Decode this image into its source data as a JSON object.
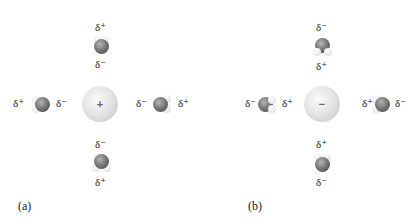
{
  "figure": {
    "panels": [
      {
        "label": "(a)",
        "ion": {
          "sign": "+",
          "description": "cation"
        },
        "waters": {
          "top": {
            "near": "δ⁻",
            "far": "δ⁺"
          },
          "bottom": {
            "near": "δ⁻",
            "far": "δ⁺"
          },
          "left": {
            "near": "δ⁻",
            "far": "δ⁺"
          },
          "right": {
            "near": "δ⁻",
            "far": "δ⁺"
          }
        }
      },
      {
        "label": "(b)",
        "ion": {
          "sign": "−",
          "description": "anion"
        },
        "waters": {
          "top": {
            "near": "δ⁺",
            "far": "δ⁻"
          },
          "bottom": {
            "near": "δ⁺",
            "far": "δ⁻"
          },
          "left": {
            "near": "δ⁺",
            "far": "δ⁻"
          },
          "right": {
            "near": "δ⁺",
            "far": "δ⁻"
          }
        }
      }
    ]
  },
  "colors": {
    "ion": "#dcdcdc",
    "oxygen": "#6e6e6e",
    "hydrogen": "#eeeeee",
    "text": "#222222"
  }
}
